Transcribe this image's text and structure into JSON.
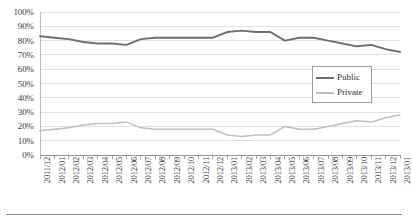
{
  "chart_data": {
    "type": "line",
    "title": "",
    "xlabel": "",
    "ylabel": "",
    "ylim": [
      0,
      100
    ],
    "grid": true,
    "legend_position": "inside-right",
    "y_tick_labels": [
      "0%",
      "10%",
      "20%",
      "30%",
      "40%",
      "50%",
      "60%",
      "70%",
      "80%",
      "90%",
      "100%"
    ],
    "y_tick_values": [
      0,
      10,
      20,
      30,
      40,
      50,
      60,
      70,
      80,
      90,
      100
    ],
    "categories": [
      "2011/12",
      "2012/01",
      "2012/02",
      "2012/03",
      "2012/04",
      "2012/05",
      "2012/06",
      "2012/07",
      "2012/08",
      "2012/09",
      "2012/10",
      "2012/11",
      "2012/12",
      "2013/01",
      "2013/02",
      "2013/03",
      "2013/04",
      "2013/05",
      "2013/06",
      "2013/07",
      "2013/08",
      "2013/09",
      "2013/10",
      "2013/11",
      "2013/12",
      "2013/01"
    ],
    "series": [
      {
        "name": "Public",
        "color": "#6e6e6e",
        "values": [
          83,
          82,
          81,
          79,
          78,
          78,
          77,
          81,
          82,
          82,
          82,
          82,
          82,
          86,
          87,
          86,
          86,
          80,
          82,
          82,
          80,
          78,
          76,
          77,
          74,
          72
        ]
      },
      {
        "name": "Private",
        "color": "#bfbfbf",
        "values": [
          17,
          18,
          19,
          21,
          22,
          22,
          23,
          19,
          18,
          18,
          18,
          18,
          18,
          14,
          13,
          14,
          14,
          20,
          18,
          18,
          20,
          22,
          24,
          23,
          26,
          28
        ]
      }
    ]
  },
  "legend": {
    "items": [
      {
        "label": "Public",
        "color": "#6e6e6e"
      },
      {
        "label": "Private",
        "color": "#bfbfbf"
      }
    ]
  }
}
